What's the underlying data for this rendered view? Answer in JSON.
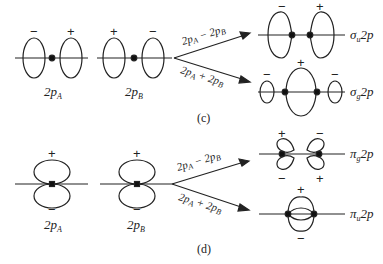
{
  "panels": [
    {
      "caption": "(c)",
      "atomic_orbitals": [
        {
          "label": "2p",
          "sub": "A",
          "signs": [
            "−",
            "+"
          ]
        },
        {
          "label": "2p",
          "sub": "B",
          "signs": [
            "+",
            "−"
          ]
        }
      ],
      "combinations": [
        {
          "expr_a": "2p",
          "sub_a": "A",
          "op": " − ",
          "expr_b": "2p",
          "sub_b": "B",
          "result": "σ",
          "result_sub": "u",
          "result_tail": "2p",
          "signs": [
            "−",
            "+"
          ]
        },
        {
          "expr_a": "2p",
          "sub_a": "A",
          "op": " + ",
          "expr_b": "2p",
          "sub_b": "B",
          "result": "σ",
          "result_sub": "g",
          "result_tail": "2p",
          "signs": [
            "−",
            "+",
            "−"
          ]
        }
      ]
    },
    {
      "caption": "(d)",
      "atomic_orbitals": [
        {
          "label": "2p",
          "sub": "A",
          "signs": [
            "+",
            "−"
          ]
        },
        {
          "label": "2p",
          "sub": "B",
          "signs": [
            "+",
            "−"
          ]
        }
      ],
      "combinations": [
        {
          "expr_a": "2p",
          "sub_a": "A",
          "op": " − ",
          "expr_b": "2p",
          "sub_b": "B",
          "result": "π",
          "result_sub": "g",
          "result_tail": "2p",
          "signs": [
            "+",
            "−",
            "−",
            "+"
          ]
        },
        {
          "expr_a": "2p",
          "sub_a": "A",
          "op": " + ",
          "expr_b": "2p",
          "sub_b": "B",
          "result": "π",
          "result_sub": "u",
          "result_tail": "2p",
          "signs": [
            "+",
            "−"
          ]
        }
      ]
    }
  ]
}
